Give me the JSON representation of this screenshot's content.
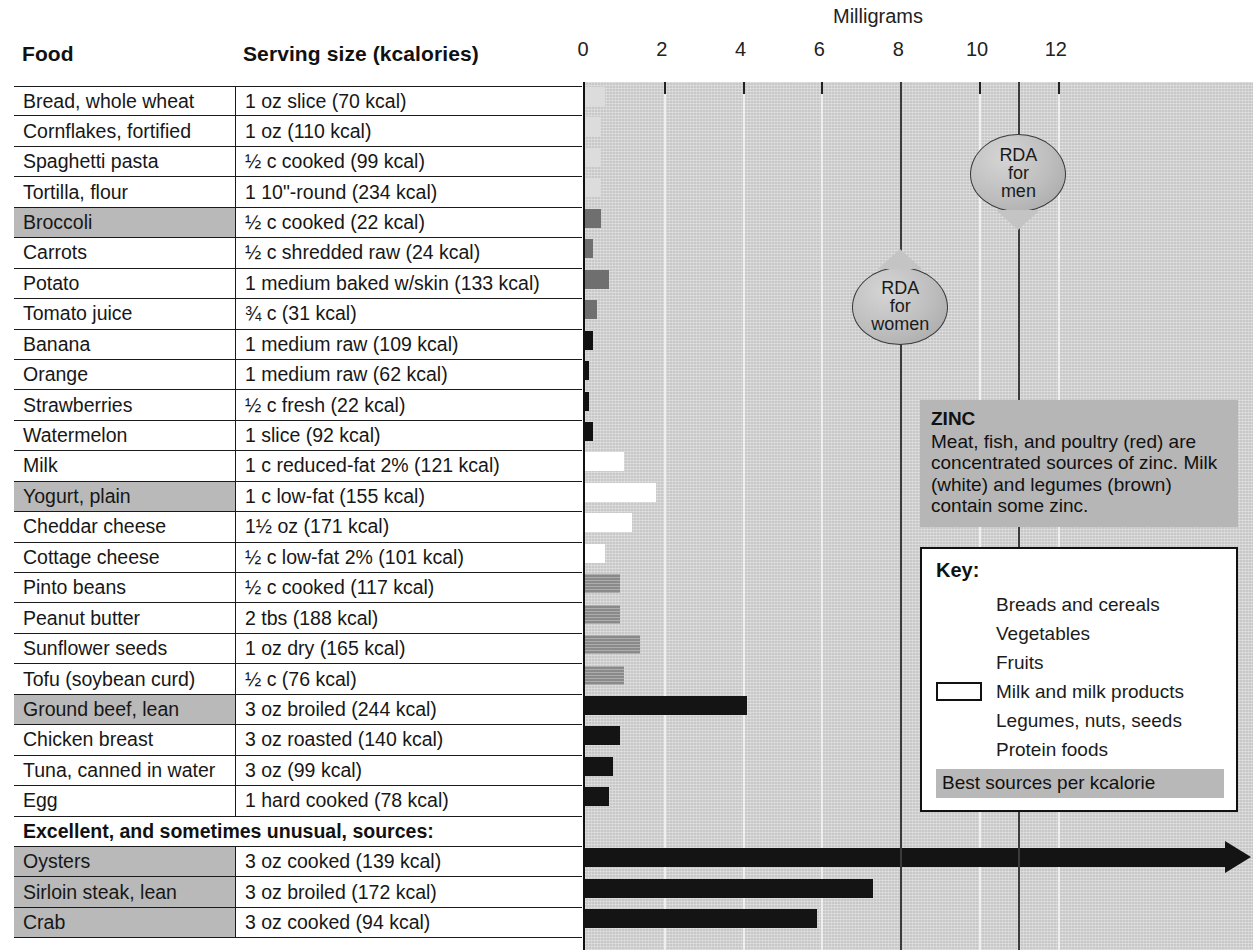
{
  "table": {
    "headers": {
      "food": "Food",
      "serving": "Serving size (kcalories)"
    },
    "section_label": "Excellent, and sometimes unusual, sources:",
    "rows": [
      {
        "food": "Bread, whole wheat",
        "serving": "1 oz slice (70 kcal)",
        "best": false
      },
      {
        "food": "Cornflakes, fortified",
        "serving": "1 oz (110 kcal)",
        "best": false
      },
      {
        "food": "Spaghetti pasta",
        "serving": "½ c cooked (99 kcal)",
        "best": false
      },
      {
        "food": "Tortilla, flour",
        "serving": "1 10\"-round (234 kcal)",
        "best": false
      },
      {
        "food": "Broccoli",
        "serving": "½ c cooked (22 kcal)",
        "best": true
      },
      {
        "food": "Carrots",
        "serving": "½ c shredded raw (24 kcal)",
        "best": false
      },
      {
        "food": "Potato",
        "serving": "1 medium baked w/skin (133 kcal)",
        "best": false
      },
      {
        "food": "Tomato juice",
        "serving": "¾ c (31 kcal)",
        "best": false
      },
      {
        "food": "Banana",
        "serving": "1 medium raw (109 kcal)",
        "best": false
      },
      {
        "food": "Orange",
        "serving": "1 medium raw (62 kcal)",
        "best": false
      },
      {
        "food": "Strawberries",
        "serving": "½ c fresh (22 kcal)",
        "best": false
      },
      {
        "food": "Watermelon",
        "serving": "1 slice (92 kcal)",
        "best": false
      },
      {
        "food": "Milk",
        "serving": "1 c reduced-fat 2% (121 kcal)",
        "best": false
      },
      {
        "food": "Yogurt, plain",
        "serving": "1 c low-fat (155 kcal)",
        "best": true
      },
      {
        "food": "Cheddar cheese",
        "serving": "1½ oz (171 kcal)",
        "best": false
      },
      {
        "food": "Cottage cheese",
        "serving": "½ c low-fat 2% (101 kcal)",
        "best": false
      },
      {
        "food": "Pinto beans",
        "serving": "½ c cooked (117 kcal)",
        "best": false
      },
      {
        "food": "Peanut butter",
        "serving": "2 tbs (188 kcal)",
        "best": false
      },
      {
        "food": "Sunflower seeds",
        "serving": "1 oz dry (165 kcal)",
        "best": false
      },
      {
        "food": "Tofu (soybean curd)",
        "serving": "½ c (76 kcal)",
        "best": false
      },
      {
        "food": "Ground beef, lean",
        "serving": "3 oz broiled (244 kcal)",
        "best": true
      },
      {
        "food": "Chicken breast",
        "serving": "3 oz roasted (140 kcal)",
        "best": false
      },
      {
        "food": "Tuna, canned in water",
        "serving": "3 oz (99 kcal)",
        "best": false
      },
      {
        "food": "Egg",
        "serving": "1 hard cooked (78 kcal)",
        "best": false
      },
      {
        "food": "Oysters",
        "serving": "3 oz cooked (139 kcal)",
        "best": true
      },
      {
        "food": "Sirloin steak, lean",
        "serving": "3 oz broiled (172 kcal)",
        "best": true
      },
      {
        "food": "Crab",
        "serving": "3 oz cooked (94 kcal)",
        "best": true
      }
    ]
  },
  "chart_data": {
    "type": "bar",
    "title": "Milligrams",
    "xlabel": "Milligrams",
    "ylabel": "",
    "xlim": [
      0,
      13
    ],
    "ticks": [
      0,
      2,
      4,
      6,
      8,
      10,
      12
    ],
    "tick_labels": [
      "0",
      "2",
      "4",
      "6",
      "8",
      "10",
      "12"
    ],
    "grid": true,
    "orientation": "horizontal",
    "categories": [
      "Bread, whole wheat",
      "Cornflakes, fortified",
      "Spaghetti pasta",
      "Tortilla, flour",
      "Broccoli",
      "Carrots",
      "Potato",
      "Tomato juice",
      "Banana",
      "Orange",
      "Strawberries",
      "Watermelon",
      "Milk",
      "Yogurt, plain",
      "Cheddar cheese",
      "Cottage cheese",
      "Pinto beans",
      "Peanut butter",
      "Sunflower seeds",
      "Tofu (soybean curd)",
      "Ground beef, lean",
      "Chicken breast",
      "Tuna, canned in water",
      "Egg",
      "Oysters",
      "Sirloin steak, lean",
      "Crab"
    ],
    "values": [
      0.5,
      0.4,
      0.4,
      0.4,
      0.4,
      0.2,
      0.6,
      0.3,
      0.2,
      0.1,
      0.1,
      0.2,
      1.0,
      1.8,
      1.2,
      0.5,
      0.9,
      0.9,
      1.4,
      1.0,
      4.1,
      0.9,
      0.7,
      0.6,
      13.5,
      7.3,
      5.9
    ],
    "value_categories": [
      "breads",
      "breads",
      "breads",
      "breads",
      "vegetables",
      "vegetables",
      "vegetables",
      "vegetables",
      "fruits",
      "fruits",
      "fruits",
      "fruits",
      "milk",
      "milk",
      "milk",
      "milk",
      "legumes",
      "legumes",
      "legumes",
      "legumes",
      "protein",
      "protein",
      "protein",
      "protein",
      "protein",
      "protein",
      "protein"
    ],
    "overflow_bars": [
      "Oysters"
    ],
    "annotations": [
      {
        "name": "rda-women",
        "label_line1": "RDA",
        "label_line2": "for",
        "label_line3": "women",
        "value": 8
      },
      {
        "name": "rda-men",
        "label_line1": "RDA",
        "label_line2": "for",
        "label_line3": "men",
        "value": 11
      }
    ]
  },
  "zinc_box": {
    "title": "ZINC",
    "body": "Meat, fish, and poultry (red) are concentrated sources of zinc. Milk (white) and legumes (brown) contain some zinc."
  },
  "key": {
    "title": "Key:",
    "items": [
      {
        "label": "Breads and cereals",
        "swatch": "cat-breads"
      },
      {
        "label": "Vegetables",
        "swatch": "cat-veg"
      },
      {
        "label": "Fruits",
        "swatch": "cat-fruit"
      },
      {
        "label": "Milk and milk products",
        "swatch": "cat-milk"
      },
      {
        "label": "Legumes, nuts, seeds",
        "swatch": "cat-legume"
      },
      {
        "label": "Protein foods",
        "swatch": "cat-protein"
      }
    ],
    "best_note": "Best sources per kcalorie"
  },
  "colors": {
    "breads": "#dcdcdc",
    "vegetables": "#6f6f6f",
    "fruits": "#111111",
    "milk": "#ffffff",
    "legumes": "#8a8a8a",
    "protein": "#141414",
    "plot_background": "#c8c8c8",
    "best_highlight": "#b9b9b9"
  }
}
